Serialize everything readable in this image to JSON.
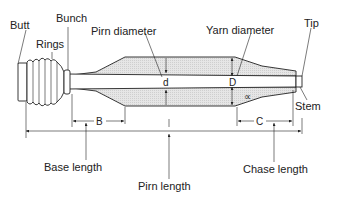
{
  "figure": {
    "parts": {
      "butt": "Butt",
      "rings": "Rings",
      "bunch": "Bunch",
      "pirn_diameter": "Pirn diameter",
      "yarn_diameter": "Yarn diameter",
      "tip": "Tip",
      "stem": "Stem"
    },
    "symbols": {
      "d": "d",
      "D": "D",
      "alpha": "∝",
      "B": "B",
      "l": "l",
      "C": "C"
    },
    "dimensions": {
      "base_length": "Base length",
      "pirn_length": "Pirn length",
      "chase_length": "Chase length"
    },
    "colors": {
      "line": "#222222",
      "yarn_fill": "#e2e2e2",
      "background": "#ffffff"
    }
  }
}
